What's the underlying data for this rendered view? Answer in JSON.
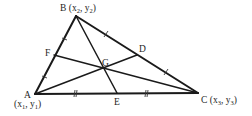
{
  "diagram": {
    "points": {
      "A": {
        "label": "A",
        "coord_label": "(x",
        "sub": "1",
        "coord_mid": ", y",
        "sub2": "1",
        "coord_end": ")"
      },
      "B": {
        "label": "B (x",
        "sub": "2",
        "coord_mid": ", y",
        "sub2": "2",
        "coord_end": ")"
      },
      "C": {
        "label": "C (x",
        "sub": "3",
        "coord_mid": ", y",
        "sub2": "3",
        "coord_end": ")"
      },
      "D": {
        "label": "D"
      },
      "E": {
        "label": "E"
      },
      "F": {
        "label": "F"
      },
      "G": {
        "label": "G"
      }
    },
    "segments": [
      "AB",
      "BC",
      "CA",
      "AD",
      "BE",
      "CF"
    ],
    "equal_marks": {
      "AF_FB": "single tick",
      "BD_DC": "single tick",
      "AE_EC": "double tick"
    },
    "colors": {
      "line": "#1a1a1a",
      "text": "#1e1e1e",
      "background": "#ffffff"
    }
  }
}
